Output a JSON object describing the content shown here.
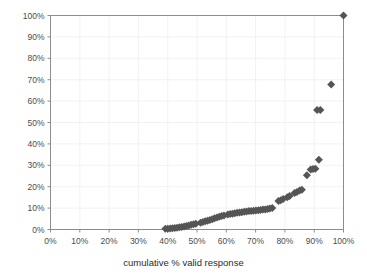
{
  "chart_data": {
    "type": "scatter",
    "title": "",
    "xlabel": "cumulative % valid response",
    "ylabel": "",
    "xlim": [
      0,
      100
    ],
    "ylim": [
      0,
      100
    ],
    "grid": true,
    "legend": "none",
    "marker": {
      "shape": "diamond",
      "color": "#555555",
      "size": 4
    },
    "xticks": [
      "0%",
      "10%",
      "20%",
      "30%",
      "40%",
      "50%",
      "60%",
      "70%",
      "80%",
      "90%",
      "100%"
    ],
    "xtick_values": [
      0,
      10,
      20,
      30,
      40,
      50,
      60,
      70,
      80,
      90,
      100
    ],
    "yticks": [
      "0%",
      "10%",
      "20%",
      "30%",
      "40%",
      "50%",
      "60%",
      "70%",
      "80%",
      "90%",
      "100%"
    ],
    "ytick_values": [
      0,
      10,
      20,
      30,
      40,
      50,
      60,
      70,
      80,
      90,
      100
    ],
    "points": [
      [
        39.2,
        0.3
      ],
      [
        40.0,
        0.4
      ],
      [
        40.8,
        0.5
      ],
      [
        41.6,
        0.6
      ],
      [
        42.4,
        0.7
      ],
      [
        43.2,
        0.8
      ],
      [
        44.0,
        1.0
      ],
      [
        44.8,
        1.2
      ],
      [
        45.6,
        1.4
      ],
      [
        46.4,
        1.6
      ],
      [
        47.2,
        1.9
      ],
      [
        48.0,
        2.2
      ],
      [
        48.8,
        2.5
      ],
      [
        49.6,
        2.7
      ],
      [
        51.2,
        3.2
      ],
      [
        52.0,
        3.5
      ],
      [
        52.8,
        3.8
      ],
      [
        53.6,
        4.1
      ],
      [
        54.4,
        4.4
      ],
      [
        55.2,
        4.8
      ],
      [
        56.0,
        5.2
      ],
      [
        56.8,
        5.6
      ],
      [
        57.6,
        6.0
      ],
      [
        58.4,
        6.3
      ],
      [
        59.2,
        6.6
      ],
      [
        60.5,
        7.0
      ],
      [
        61.3,
        7.2
      ],
      [
        62.1,
        7.4
      ],
      [
        62.9,
        7.6
      ],
      [
        63.7,
        7.8
      ],
      [
        64.5,
        7.9
      ],
      [
        65.3,
        8.1
      ],
      [
        66.1,
        8.3
      ],
      [
        66.9,
        8.4
      ],
      [
        67.7,
        8.6
      ],
      [
        68.5,
        8.7
      ],
      [
        69.3,
        8.8
      ],
      [
        70.1,
        8.9
      ],
      [
        70.9,
        9.0
      ],
      [
        71.7,
        9.1
      ],
      [
        72.5,
        9.3
      ],
      [
        73.3,
        9.4
      ],
      [
        74.1,
        9.6
      ],
      [
        74.9,
        9.8
      ],
      [
        75.7,
        10.0
      ],
      [
        77.8,
        13.3
      ],
      [
        78.6,
        13.7
      ],
      [
        79.4,
        14.2
      ],
      [
        80.8,
        15.1
      ],
      [
        81.6,
        15.6
      ],
      [
        83.3,
        17.0
      ],
      [
        84.1,
        17.5
      ],
      [
        85.0,
        18.2
      ],
      [
        85.8,
        18.6
      ],
      [
        87.5,
        25.4
      ],
      [
        88.8,
        28.0
      ],
      [
        89.6,
        28.3
      ],
      [
        90.4,
        28.4
      ],
      [
        91.6,
        32.6
      ],
      [
        91.0,
        55.8
      ],
      [
        92.1,
        55.8
      ],
      [
        95.8,
        67.8
      ],
      [
        100.0,
        100.0
      ]
    ]
  }
}
